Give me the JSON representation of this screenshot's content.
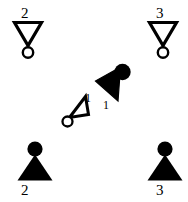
{
  "canvas": {
    "width": 188,
    "height": 202,
    "background": "#ffffff",
    "stroke_color": "#000000",
    "fill_color": "#000000"
  },
  "diagram": {
    "goals": [
      {
        "id": "goal-2",
        "label": "2",
        "style": "hollow-down-triangle-with-circle",
        "position": "top-left",
        "x": 28,
        "y": 35
      },
      {
        "id": "goal-3",
        "label": "3",
        "style": "hollow-down-triangle-with-circle",
        "position": "top-right",
        "x": 163,
        "y": 35
      },
      {
        "id": "goal-1",
        "label": "1",
        "style": "hollow-tilted-triangle-with-circle",
        "position": "center-left",
        "x": 78,
        "y": 108
      }
    ],
    "robots": [
      {
        "id": "robot-2",
        "label": "2",
        "style": "filled-up-triangle-with-circle",
        "position": "bottom-left",
        "x": 35,
        "y": 168
      },
      {
        "id": "robot-3",
        "label": "3",
        "style": "filled-up-triangle-with-circle",
        "position": "bottom-right",
        "x": 165,
        "y": 168
      },
      {
        "id": "robot-1",
        "label": "1",
        "style": "filled-tilted-triangle-with-circle",
        "position": "center-right",
        "x": 110,
        "y": 82
      }
    ]
  }
}
